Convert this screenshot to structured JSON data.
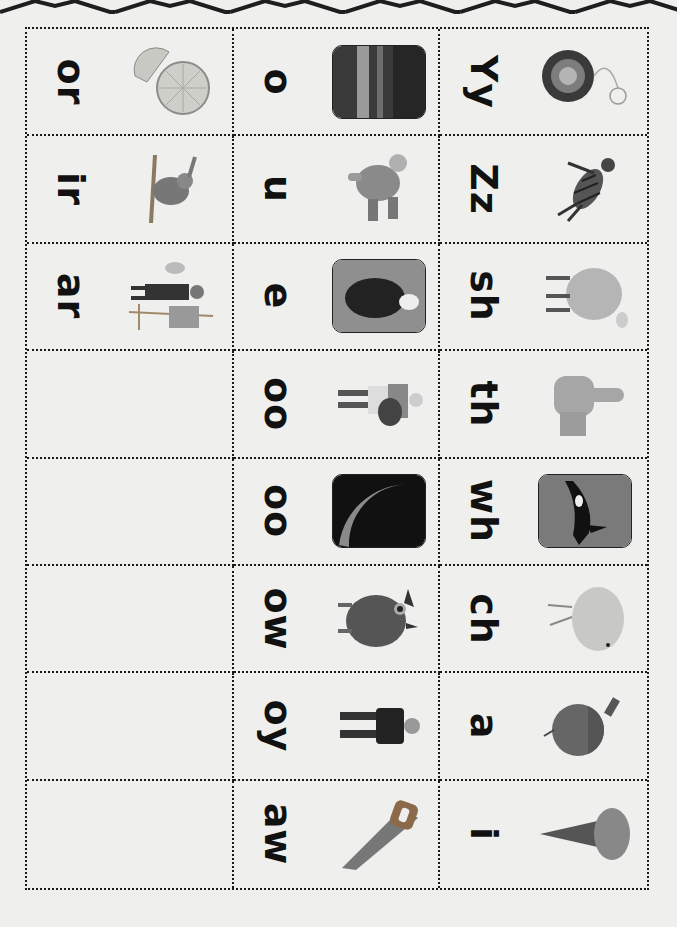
{
  "decoration": {
    "top_border": "zigzag-chevron-border"
  },
  "grid": {
    "columns": 3,
    "rows": 8,
    "orientation": "rotated-90-clockwise"
  },
  "cards": {
    "col1": [
      {
        "label": "or",
        "picture": "orange-icon",
        "framed": false
      },
      {
        "label": "ir",
        "picture": "bird-icon",
        "framed": false
      },
      {
        "label": "ar",
        "picture": "artist-icon",
        "framed": false
      },
      {
        "label": "",
        "picture": "",
        "framed": false
      },
      {
        "label": "",
        "picture": "",
        "framed": false
      },
      {
        "label": "",
        "picture": "",
        "framed": false
      },
      {
        "label": "",
        "picture": "",
        "framed": false
      },
      {
        "label": "",
        "picture": "",
        "framed": false
      }
    ],
    "col2": [
      {
        "label": "o",
        "picture": "ocean-icon",
        "framed": true
      },
      {
        "label": "u",
        "picture": "puppet-icon",
        "framed": false
      },
      {
        "label": "e",
        "picture": "eagle-icon",
        "framed": true
      },
      {
        "label": "oo",
        "picture": "cook-icon",
        "framed": false
      },
      {
        "label": "oo",
        "picture": "moon-icon",
        "framed": true
      },
      {
        "label": "ow",
        "picture": "owl-icon",
        "framed": false
      },
      {
        "label": "oy",
        "picture": "boy-icon",
        "framed": false
      },
      {
        "label": "aw",
        "picture": "saw-icon",
        "framed": false
      }
    ],
    "col3": [
      {
        "label": "Yy",
        "picture": "yoyo-icon",
        "framed": false
      },
      {
        "label": "Zz",
        "picture": "zebra-icon",
        "framed": false
      },
      {
        "label": "sh",
        "picture": "sheep-icon",
        "framed": false
      },
      {
        "label": "th",
        "picture": "thumb-icon",
        "framed": false
      },
      {
        "label": "wh",
        "picture": "whale-icon",
        "framed": true
      },
      {
        "label": "ch",
        "picture": "chick-icon",
        "framed": false
      },
      {
        "label": "a",
        "picture": "acorn-icon",
        "framed": false
      },
      {
        "label": "i",
        "picture": "ice-cream-icon",
        "framed": false
      }
    ]
  },
  "colors": {
    "paper": "#efefed",
    "ink": "#111111",
    "border": "#1a1a1a"
  }
}
